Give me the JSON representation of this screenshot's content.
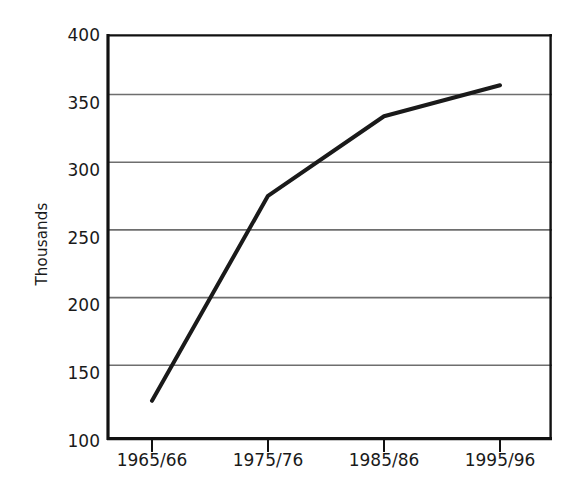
{
  "chart_data": {
    "type": "line",
    "title": "",
    "subtitle": "",
    "xlabel": "",
    "ylabel": "Thousands",
    "categories": [
      "1965/66",
      "1975/76",
      "1985/86",
      "1995/96"
    ],
    "values": [
      128,
      280,
      339,
      362
    ],
    "series": [
      {
        "name": "Thousands",
        "values": [
          128,
          280,
          339,
          362
        ]
      }
    ],
    "ylim": [
      100,
      400
    ],
    "yticks": [
      100,
      150,
      200,
      250,
      300,
      350,
      400
    ],
    "ytick_labels": [
      "100",
      "150",
      "200",
      "250",
      "300",
      "350",
      "400"
    ],
    "xtick_labels": [
      "1965/66",
      "1975/76",
      "1985/86",
      "1995/96"
    ],
    "grid": true,
    "grid_axis": "y",
    "legend": false,
    "legend_position": "none",
    "annotations": [],
    "colors": {
      "line": "#1a1a1a",
      "grid": "#6e6e6e",
      "axis": "#000000",
      "text": "#1a1a1a",
      "background": "#ffffff"
    },
    "line_width_px": 4,
    "markers": false
  },
  "axis": {
    "y_title": "Thousands"
  }
}
